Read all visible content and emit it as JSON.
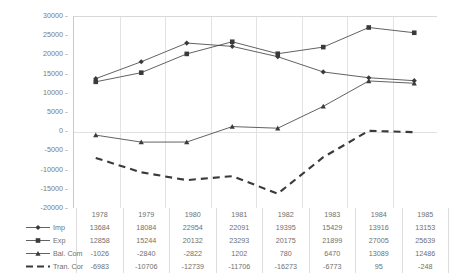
{
  "chart_data": {
    "type": "line",
    "title": "",
    "subtitle": "",
    "xlabel": "",
    "ylabel": "",
    "categories": [
      "1978",
      "1979",
      "1980",
      "1981",
      "1982",
      "1983",
      "1984",
      "1985"
    ],
    "ylim": [
      -20000,
      30000
    ],
    "ytick_step": 5000,
    "yticks": [
      "30000",
      "25000",
      "20000",
      "15000",
      "10000",
      "5000",
      "0",
      "-5000",
      "-10000",
      "-15000",
      "-20000"
    ],
    "grid": "vertical-and-zero-line",
    "legend_position": "table-left-column",
    "series": [
      {
        "name": "Imp",
        "marker": "diamond",
        "line_style": "solid",
        "color": "#3a3a3a",
        "values": [
          13684,
          18084,
          22954,
          22091,
          19395,
          15429,
          13916,
          13153
        ]
      },
      {
        "name": "Exp",
        "marker": "square",
        "line_style": "solid",
        "color": "#3a3a3a",
        "values": [
          12858,
          15244,
          20132,
          23293,
          20175,
          21899,
          27005,
          25639
        ]
      },
      {
        "name": "Bal. Com",
        "marker": "triangle",
        "line_style": "solid",
        "color": "#3a3a3a",
        "values": [
          -1026,
          -2840,
          -2822,
          1202,
          780,
          6470,
          13089,
          12486
        ]
      },
      {
        "name": "Tran. Cor",
        "marker": "none",
        "line_style": "dashed",
        "color": "#3a3a3a",
        "values": [
          -6983,
          -10706,
          -12739,
          -11706,
          -16273,
          -6773,
          95,
          -248
        ]
      }
    ]
  },
  "table": {
    "corner_label": "",
    "header": [
      "1978",
      "1979",
      "1980",
      "1981",
      "1982",
      "1983",
      "1984",
      "1985"
    ],
    "rows": [
      {
        "label": "Imp",
        "values": [
          "13684",
          "18084",
          "22954",
          "22091",
          "19395",
          "15429",
          "13916",
          "13153"
        ]
      },
      {
        "label": "Exp",
        "values": [
          "12858",
          "15244",
          "20132",
          "23293",
          "20175",
          "21899",
          "27005",
          "25639"
        ]
      },
      {
        "label": "Bal. Com",
        "values": [
          "-1026",
          "-2840",
          "-2822",
          "1202",
          "780",
          "6470",
          "13089",
          "12486"
        ]
      },
      {
        "label": "Tran. Cor",
        "values": [
          "-6983",
          "-10706",
          "-12739",
          "-11706",
          "-16273",
          "-6773",
          "95",
          "-248"
        ]
      }
    ]
  },
  "colors": {
    "plot_line": "#3a3a3a",
    "axis": "#c9c9c9",
    "gridline": "#e3e3e3",
    "text": "#6f6f6f",
    "background": "#ffffff"
  }
}
